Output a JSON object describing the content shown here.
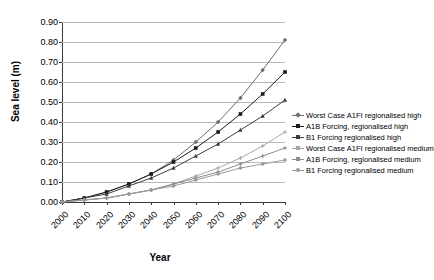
{
  "chart_data": {
    "type": "line",
    "title": "",
    "xlabel": "Year",
    "ylabel": "Sea level (m)",
    "xlim": [
      2000,
      2100
    ],
    "ylim": [
      0.0,
      0.9
    ],
    "grid": "horizontal",
    "legend_position": "right",
    "x": [
      2000,
      2010,
      2020,
      2030,
      2040,
      2050,
      2060,
      2070,
      2080,
      2090,
      2100
    ],
    "xtick_labels": [
      "2000",
      "2010",
      "2020",
      "2030",
      "2040",
      "2050",
      "2060",
      "2070",
      "2080",
      "2090",
      "2100"
    ],
    "ytick_labels": [
      "0.00",
      "0.10",
      "0.20",
      "0.30",
      "0.40",
      "0.50",
      "0.60",
      "0.70",
      "0.80",
      "0.90"
    ],
    "ytick_values": [
      0.0,
      0.1,
      0.2,
      0.3,
      0.4,
      0.5,
      0.6,
      0.7,
      0.8,
      0.9
    ],
    "series": [
      {
        "name": "Worst Case A1FI regionalised high",
        "color": "#6e6e6e",
        "marker": "diamond",
        "values": [
          0.0,
          0.02,
          0.05,
          0.09,
          0.14,
          0.21,
          0.3,
          0.4,
          0.52,
          0.66,
          0.81
        ]
      },
      {
        "name": "A1B Forcing, regionalised high",
        "color": "#1a1a1a",
        "marker": "square",
        "values": [
          0.0,
          0.02,
          0.05,
          0.09,
          0.14,
          0.2,
          0.27,
          0.35,
          0.44,
          0.54,
          0.65
        ]
      },
      {
        "name": "B1 Forcing regionalised high",
        "color": "#3d3d3d",
        "marker": "triangle",
        "values": [
          0.0,
          0.02,
          0.04,
          0.08,
          0.12,
          0.17,
          0.23,
          0.29,
          0.36,
          0.43,
          0.51
        ]
      },
      {
        "name": "Worst Case A1FI regionalised medium",
        "color": "#a8a8a8",
        "marker": "cross",
        "values": [
          0.0,
          0.01,
          0.02,
          0.04,
          0.06,
          0.09,
          0.13,
          0.17,
          0.22,
          0.28,
          0.35
        ]
      },
      {
        "name": "A1B Forcing, regionalised medium",
        "color": "#8c8c8c",
        "marker": "asterisk",
        "values": [
          0.0,
          0.01,
          0.02,
          0.04,
          0.06,
          0.09,
          0.12,
          0.15,
          0.19,
          0.23,
          0.27
        ]
      },
      {
        "name": "B1 Forcing regionalised medium",
        "color": "#9a9a9a",
        "marker": "circle",
        "values": [
          0.0,
          0.01,
          0.02,
          0.04,
          0.06,
          0.08,
          0.11,
          0.14,
          0.17,
          0.19,
          0.21
        ]
      }
    ]
  }
}
